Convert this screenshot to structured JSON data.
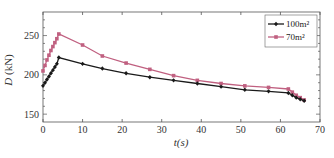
{
  "chart_data": {
    "type": "line",
    "title": "",
    "xlabel": "t(s)",
    "ylabel": "D (kN)",
    "xlim": [
      0,
      70
    ],
    "ylim": [
      140,
      280
    ],
    "x_ticks": [
      0,
      10,
      20,
      30,
      40,
      50,
      60,
      70
    ],
    "y_ticks": [
      150,
      200,
      250
    ],
    "grid": false,
    "legend_position": "upper right",
    "series": [
      {
        "name": "100m²",
        "color": "#1a1a1a",
        "marker": "diamond",
        "x": [
          0,
          0.5,
          1,
          1.5,
          2,
          2.5,
          3,
          3.5,
          4,
          10,
          15,
          21,
          27,
          33,
          39,
          45,
          51,
          57,
          62,
          63,
          64,
          65,
          66
        ],
        "y": [
          186,
          190,
          194,
          198,
          202,
          206,
          210,
          214,
          222,
          214,
          208,
          202,
          197,
          193,
          189,
          185,
          181,
          179,
          177,
          174,
          171,
          169,
          167
        ]
      },
      {
        "name": "70m²",
        "color": "#c06080",
        "marker": "square",
        "x": [
          0,
          0.5,
          1,
          1.5,
          2,
          2.5,
          3,
          3.5,
          4,
          10,
          15,
          21,
          27,
          33,
          39,
          45,
          51,
          57,
          62,
          63,
          64,
          65,
          66
        ],
        "y": [
          205,
          212,
          219,
          225,
          231,
          236,
          241,
          246,
          252,
          238,
          224,
          215,
          207,
          199,
          193,
          189,
          186,
          184,
          182,
          178,
          174,
          171,
          168
        ]
      }
    ]
  },
  "labels": {
    "ylabel_main": "D",
    "ylabel_unit": " (kN)",
    "xlabel": "t(s)",
    "legend": [
      "100m²",
      "70m²"
    ]
  }
}
